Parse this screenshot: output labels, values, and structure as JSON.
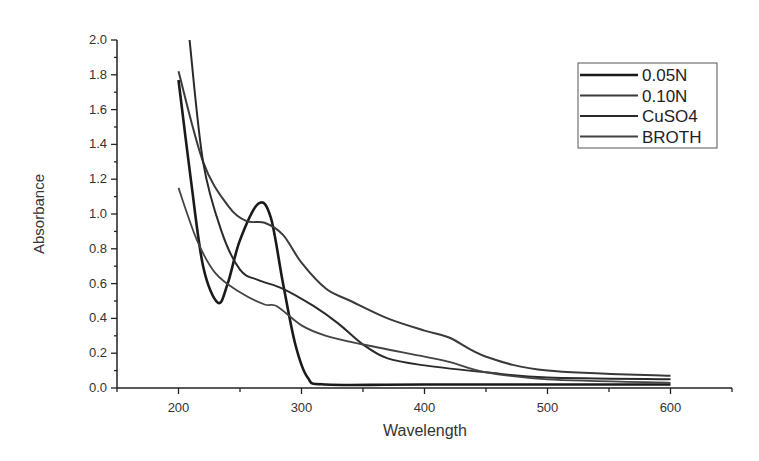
{
  "chart_data": {
    "type": "line",
    "title": "",
    "xlabel": "Wavelength",
    "ylabel": "Absorbance",
    "xlim": [
      150,
      650
    ],
    "ylim": [
      0.0,
      2.0
    ],
    "xticks": [
      200,
      300,
      400,
      500,
      600
    ],
    "yticks": [
      0.0,
      0.2,
      0.4,
      0.6,
      0.8,
      1.0,
      1.2,
      1.4,
      1.6,
      1.8,
      2.0
    ],
    "grid": false,
    "legend_position": "upper right",
    "series": [
      {
        "name": "0.05N",
        "color": "#1a1a1a",
        "width": 2.6,
        "x": [
          200,
          210,
          220,
          232,
          240,
          250,
          265,
          275,
          285,
          295,
          305,
          320,
          400,
          600
        ],
        "y": [
          1.77,
          1.2,
          0.7,
          0.49,
          0.6,
          0.85,
          1.06,
          0.98,
          0.6,
          0.25,
          0.06,
          0.02,
          0.02,
          0.02
        ]
      },
      {
        "name": "0.10N",
        "color": "#3a3a3a",
        "width": 2.0,
        "x": [
          200,
          220,
          240,
          255,
          270,
          285,
          300,
          320,
          340,
          370,
          400,
          420,
          450,
          500,
          600
        ],
        "y": [
          1.82,
          1.3,
          1.05,
          0.96,
          0.95,
          0.88,
          0.72,
          0.57,
          0.5,
          0.4,
          0.33,
          0.29,
          0.18,
          0.1,
          0.07
        ]
      },
      {
        "name": "CuSO4",
        "color": "#2a2a2a",
        "width": 2.0,
        "x": [
          209,
          220,
          235,
          250,
          265,
          285,
          310,
          330,
          350,
          370,
          400,
          450,
          500,
          600
        ],
        "y": [
          2.0,
          1.3,
          0.9,
          0.68,
          0.62,
          0.57,
          0.47,
          0.37,
          0.25,
          0.17,
          0.13,
          0.09,
          0.06,
          0.05
        ]
      },
      {
        "name": "BROTH",
        "color": "#444444",
        "width": 1.8,
        "x": [
          200,
          215,
          230,
          250,
          270,
          280,
          300,
          320,
          350,
          400,
          420,
          450,
          500,
          600
        ],
        "y": [
          1.15,
          0.85,
          0.66,
          0.55,
          0.48,
          0.47,
          0.36,
          0.3,
          0.25,
          0.18,
          0.15,
          0.09,
          0.05,
          0.03
        ]
      }
    ]
  }
}
